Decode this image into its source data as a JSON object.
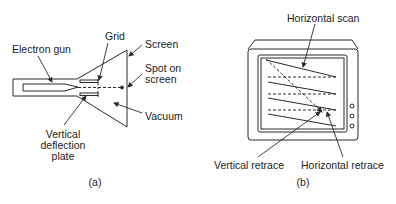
{
  "panel_a": {
    "caption": "(a)",
    "labels": {
      "electron_gun": "Electron gun",
      "grid": "Grid",
      "screen": "Screen",
      "spot_on_screen_1": "Spot on",
      "spot_on_screen_2": "screen",
      "vacuum": "Vacuum",
      "vertical_deflection_1": "Vertical",
      "vertical_deflection_2": "deflection",
      "vertical_deflection_3": "plate"
    }
  },
  "panel_b": {
    "caption": "(b)",
    "labels": {
      "horizontal_scan": "Horizontal scan",
      "vertical_retrace": "Vertical retrace",
      "horizontal_retrace": "Horizontal retrace"
    }
  },
  "colors": {
    "line": "#2a2a2a",
    "background": "#ffffff"
  }
}
